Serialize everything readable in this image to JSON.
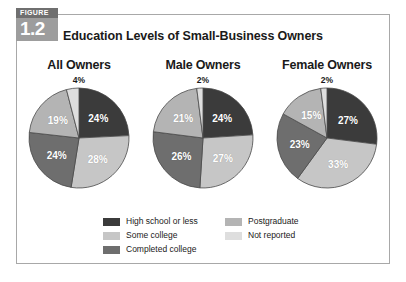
{
  "figure": {
    "badge_kicker": "FIGURE",
    "badge_number": "1.2",
    "title": "Education Levels of Small-Business Owners"
  },
  "colors": {
    "high_school_or_less": "#3b3b3b",
    "some_college": "#c6c6c6",
    "completed_college": "#6e6e6e",
    "postgraduate": "#b4b4b4",
    "not_reported": "#dedede",
    "slice_stroke": "#4a4a4a",
    "frame_border": "#a8a8a8",
    "badge_top_bg": "#6f6f6f",
    "badge_num_bg": "#9d9d9d",
    "text": "#1a1a1a"
  },
  "legend": {
    "column1": [
      {
        "label": "High school or less",
        "color": "#3b3b3b",
        "key": "high_school_or_less"
      },
      {
        "label": "Some college",
        "color": "#c6c6c6",
        "key": "some_college"
      },
      {
        "label": "Completed college",
        "color": "#6e6e6e",
        "key": "completed_college"
      }
    ],
    "column2": [
      {
        "label": "Postgraduate",
        "color": "#b4b4b4",
        "key": "postgraduate"
      },
      {
        "label": "Not reported",
        "color": "#dedede",
        "key": "not_reported"
      }
    ]
  },
  "chart_data": {
    "type": "pie",
    "title": "Education Levels of Small-Business Owners",
    "categories": [
      "High school or less",
      "Some college",
      "Completed college",
      "Postgraduate",
      "Not reported"
    ],
    "category_colors": [
      "#3b3b3b",
      "#c6c6c6",
      "#6e6e6e",
      "#b4b4b4",
      "#dedede"
    ],
    "units": "percent",
    "legend_position": "bottom",
    "charts": [
      {
        "title": "All Owners",
        "values": [
          24,
          28,
          24,
          19,
          4
        ],
        "labels": [
          "24%",
          "28%",
          "24%",
          "19%",
          "4%"
        ],
        "outside_label": "4%",
        "outside_label_index": 4
      },
      {
        "title": "Male Owners",
        "values": [
          24,
          27,
          26,
          21,
          2
        ],
        "labels": [
          "24%",
          "27%",
          "26%",
          "21%",
          "2%"
        ],
        "outside_label": "2%",
        "outside_label_index": 4
      },
      {
        "title": "Female Owners",
        "values": [
          27,
          33,
          23,
          15,
          2
        ],
        "labels": [
          "27%",
          "33%",
          "23%",
          "15%",
          "2%"
        ],
        "outside_label": "2%",
        "outside_label_index": 4
      }
    ]
  }
}
